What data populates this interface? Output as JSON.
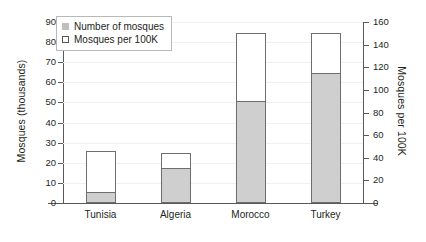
{
  "chart_data": {
    "type": "bar",
    "title": "",
    "subtitle": "",
    "categories": [
      "Tunisia",
      "Algeria",
      "Morocco",
      "Turkey"
    ],
    "series": [
      {
        "name": "Number of mosques",
        "axis": "left",
        "unit": "thousands",
        "values": [
          5,
          17,
          50,
          64
        ]
      },
      {
        "name": "Mosques per 100K",
        "axis": "right",
        "unit": "per 100K",
        "values": [
          46,
          44,
          150,
          150
        ]
      }
    ],
    "xlabel": "",
    "ylabel": "Mosques (thousands)",
    "ylabel_right": "Mosques per 100K",
    "ylim": [
      0,
      90
    ],
    "ylim_right": [
      0,
      160
    ],
    "yticks": [
      0,
      10,
      20,
      30,
      40,
      50,
      60,
      70,
      80,
      90
    ],
    "yticks_right": [
      0,
      20,
      40,
      60,
      80,
      100,
      120,
      140,
      160
    ],
    "grid": true,
    "legend_position": "top-left",
    "legend": [
      "Number of mosques",
      "Mosques per 100K"
    ],
    "colors": {
      "filled_bar": "#cfcfcf",
      "hollow_bar": "#ffffff",
      "bar_outline": "#6d6e71",
      "axis": "#58595b",
      "text": "#231f20",
      "gridline": "#f0f0f0"
    }
  }
}
